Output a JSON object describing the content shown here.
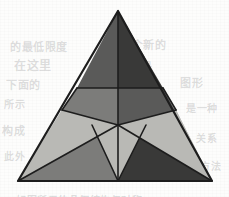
{
  "canvas": {
    "width": 229,
    "height": 197,
    "background_color": "#fdfdfc",
    "description": "Scanned geometric diagram: an equilateral triangle subdivided into shaded facets forming a five-pointed star motif"
  },
  "palette": {
    "outline": "#1d1d1d",
    "light_gray": "#b9b9b5",
    "medium_gray": "#7c7c7a",
    "dark_gray": "#5a5a59",
    "darkest_gray": "#393938",
    "paper": "#fdfdfc"
  },
  "figure": {
    "name": "shaded-equilateral-triangle",
    "outer_triangle": {
      "apex": [
        118,
        11
      ],
      "bottom_left": [
        18,
        181
      ],
      "bottom_right": [
        212,
        181
      ],
      "stroke": "#1d1d1d",
      "stroke_width": 2.2
    },
    "key_points": {
      "apex": [
        118,
        11
      ],
      "bottom_left": [
        18,
        181
      ],
      "bottom_right": [
        212,
        181
      ],
      "bottom_center": [
        118,
        181
      ],
      "upper_band_left": [
        77,
        88
      ],
      "upper_band_right": [
        163,
        88
      ],
      "star_center": [
        118,
        125
      ],
      "star_left_point": [
        62,
        110
      ],
      "star_right_point": [
        176,
        110
      ],
      "inner_left": [
        92,
        125
      ],
      "inner_right": [
        146,
        125
      ],
      "inner_top": [
        118,
        88
      ]
    },
    "facets": [
      {
        "id": "apex-left",
        "label": "Upper left facet",
        "points": "118,11 77,88 118,88",
        "fill": "#5a5a59"
      },
      {
        "id": "apex-right",
        "label": "Upper right facet",
        "points": "118,11 118,88 163,88",
        "fill": "#393938"
      },
      {
        "id": "left-flank",
        "label": "Left flank facet",
        "points": "77,88 18,181 62,110",
        "fill": "#b9b9b5"
      },
      {
        "id": "left-wedge",
        "label": "Left star wedge",
        "points": "62,110 18,181 118,125",
        "fill": "#b9b9b5"
      },
      {
        "id": "star-upper-left",
        "label": "Star upper-left ray",
        "points": "77,88 118,88 118,125 62,110",
        "fill": "#7c7c7a"
      },
      {
        "id": "star-upper-right",
        "label": "Star upper-right ray",
        "points": "118,88 163,88 176,110 118,125",
        "fill": "#5a5a59"
      },
      {
        "id": "right-flank",
        "label": "Right flank facet",
        "points": "163,88 212,181 176,110",
        "fill": "#b9b9b5"
      },
      {
        "id": "right-wedge",
        "label": "Right star wedge",
        "points": "176,110 212,181 118,125",
        "fill": "#b9b9b5"
      },
      {
        "id": "bottom-left-dark",
        "label": "Bottom left dark facet",
        "points": "18,181 118,125 118,181",
        "fill": "#7c7c7a"
      },
      {
        "id": "bottom-right-dark",
        "label": "Bottom right dark facet",
        "points": "118,125 212,181 118,181",
        "fill": "#393938"
      },
      {
        "id": "bottom-center-light",
        "label": "Bottom center star point",
        "points": "92,125 146,125 118,181",
        "fill": "#b9b9b5"
      }
    ],
    "internal_edges": [
      "118,11 118,88",
      "77,88 163,88",
      "77,88 62,110",
      "163,88 176,110",
      "62,110 118,125",
      "176,110 118,125",
      "118,88 118,125",
      "18,181 118,125",
      "212,181 118,125",
      "92,125 118,181",
      "146,125 118,181",
      "118,125 118,181"
    ]
  },
  "bleed_through": [
    {
      "text": "的最低限度",
      "x": 10,
      "y": 38,
      "size": 11
    },
    {
      "text": "一个新的",
      "x": 120,
      "y": 36,
      "size": 11
    },
    {
      "text": "在这里",
      "x": 14,
      "y": 56,
      "size": 12
    },
    {
      "text": "可以说是",
      "x": 110,
      "y": 58,
      "size": 10
    },
    {
      "text": "下面的",
      "x": 6,
      "y": 76,
      "size": 11
    },
    {
      "text": "图形",
      "x": 180,
      "y": 74,
      "size": 11
    },
    {
      "text": "所示",
      "x": 4,
      "y": 96,
      "size": 10
    },
    {
      "text": "是一种",
      "x": 186,
      "y": 100,
      "size": 10
    },
    {
      "text": "构成",
      "x": 2,
      "y": 122,
      "size": 11
    },
    {
      "text": "关系",
      "x": 196,
      "y": 130,
      "size": 10
    },
    {
      "text": "此外",
      "x": 4,
      "y": 148,
      "size": 10
    },
    {
      "text": "方法",
      "x": 200,
      "y": 158,
      "size": 10
    },
    {
      "text": "如图所示的几何结构与对称",
      "x": 16,
      "y": 192,
      "size": 10
    }
  ]
}
